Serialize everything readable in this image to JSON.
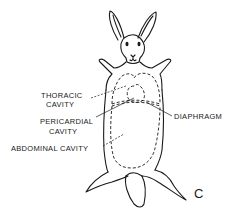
{
  "figure": {
    "panel_letter": "C",
    "labels": {
      "thoracic_line1": "THORACIC",
      "thoracic_line2": "CAVITY",
      "pericardial_line1": "PERICARDIAL",
      "pericardial_line2": "CAVITY",
      "abdominal": "ABDOMINAL CAVITY",
      "diaphragm": "DIAPHRAGM"
    }
  }
}
